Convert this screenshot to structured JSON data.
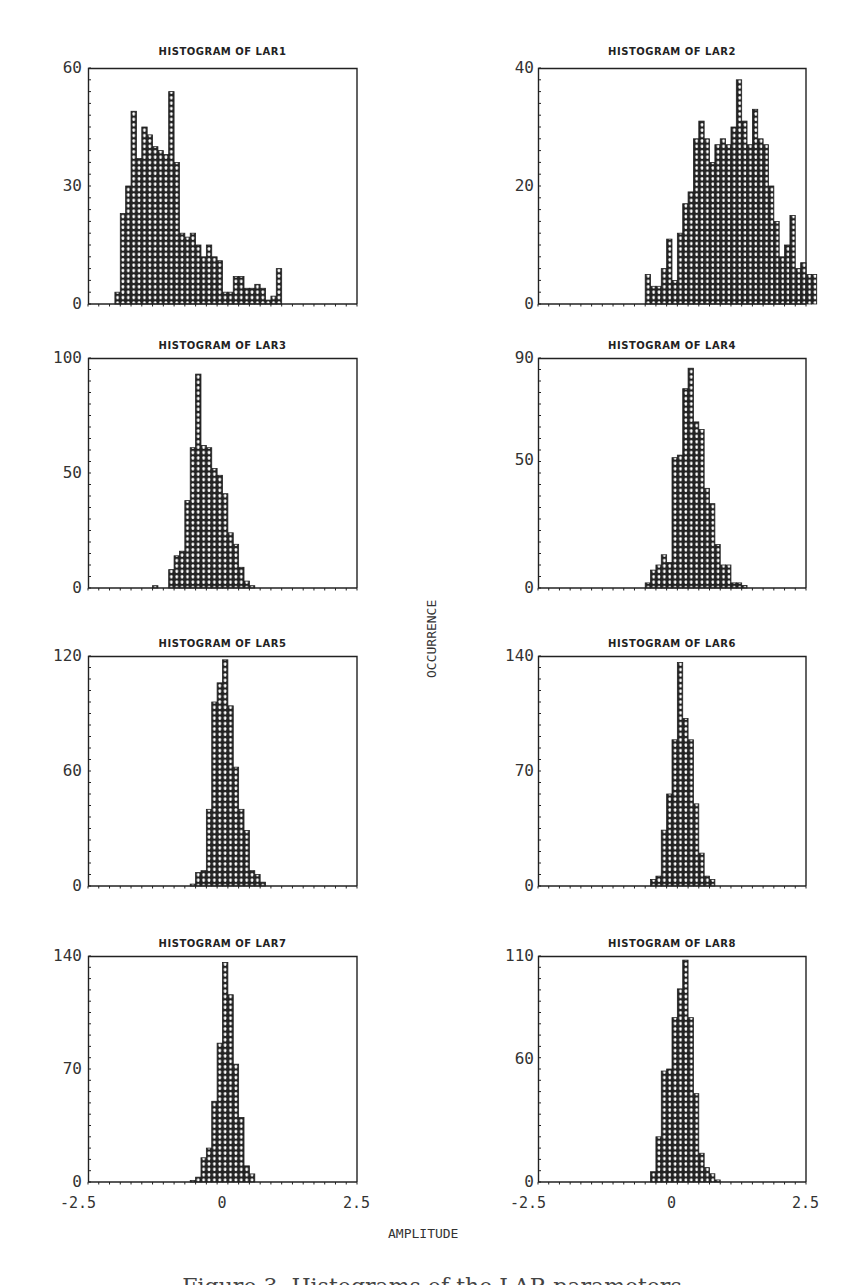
{
  "figure": {
    "y_axis_label": "OCCURRENCE",
    "x_axis_label": "AMPLITUDE",
    "x_ticks": [
      "-2.5",
      "0",
      "2.5"
    ],
    "caption_partial": "Figure 3. Histograms of the LAR parameters"
  },
  "style": {
    "ink": "#222222",
    "fill": "#ffffff"
  },
  "chart_data": [
    {
      "type": "bar",
      "title": "HISTOGRAM OF LAR1",
      "xlabel": "AMPLITUDE",
      "ylabel": "OCCURRENCE",
      "xlim": [
        -2.5,
        2.5
      ],
      "ylim": [
        0,
        60
      ],
      "y_ticks": [
        "60",
        "30",
        "0"
      ],
      "bin_width": 0.1,
      "bin_start": -2.0,
      "values": [
        3,
        23,
        30,
        49,
        37,
        45,
        43,
        40,
        39,
        38,
        54,
        36,
        18,
        17,
        18,
        15,
        12,
        15,
        12,
        11,
        3,
        3,
        7,
        7,
        4,
        4,
        5,
        4,
        1,
        2,
        9
      ]
    },
    {
      "type": "bar",
      "title": "HISTOGRAM OF LAR2",
      "xlabel": "AMPLITUDE",
      "ylabel": "OCCURRENCE",
      "xlim": [
        -2.5,
        2.5
      ],
      "ylim": [
        0,
        40
      ],
      "y_ticks": [
        "40",
        "20",
        "0"
      ],
      "bin_width": 0.1,
      "bin_start": -0.5,
      "values": [
        5,
        3,
        3,
        6,
        11,
        4,
        12,
        17,
        19,
        28,
        31,
        28,
        24,
        27,
        28,
        27,
        30,
        38,
        31,
        27,
        33,
        28,
        27,
        20,
        14,
        8,
        10,
        15,
        6,
        7,
        5,
        5
      ]
    },
    {
      "type": "bar",
      "title": "HISTOGRAM OF LAR3",
      "xlabel": "AMPLITUDE",
      "ylabel": "OCCURRENCE",
      "xlim": [
        -2.5,
        2.5
      ],
      "ylim": [
        0,
        100
      ],
      "y_ticks": [
        "100",
        "50",
        "0"
      ],
      "bin_width": 0.1,
      "bin_start": -1.3,
      "values": [
        1,
        0,
        0,
        8,
        14,
        16,
        38,
        61,
        93,
        62,
        61,
        52,
        49,
        41,
        24,
        19,
        9,
        3,
        1
      ]
    },
    {
      "type": "bar",
      "title": "HISTOGRAM OF LAR4",
      "xlabel": "AMPLITUDE",
      "ylabel": "OCCURRENCE",
      "xlim": [
        -2.5,
        2.5
      ],
      "ylim": [
        0,
        90
      ],
      "y_ticks": [
        "90",
        "50",
        "0"
      ],
      "bin_width": 0.1,
      "bin_start": -0.5,
      "values": [
        2,
        7,
        9,
        13,
        10,
        51,
        52,
        78,
        86,
        65,
        62,
        39,
        33,
        17,
        9,
        9,
        2,
        2,
        1
      ]
    },
    {
      "type": "bar",
      "title": "HISTOGRAM OF LAR5",
      "xlabel": "AMPLITUDE",
      "ylabel": "OCCURRENCE",
      "xlim": [
        -2.5,
        2.5
      ],
      "ylim": [
        0,
        120
      ],
      "y_ticks": [
        "120",
        "60",
        "0"
      ],
      "bin_width": 0.1,
      "bin_start": -0.6,
      "values": [
        1,
        7,
        8,
        40,
        96,
        106,
        118,
        94,
        62,
        40,
        29,
        8,
        6,
        2
      ]
    },
    {
      "type": "bar",
      "title": "HISTOGRAM OF LAR6",
      "xlabel": "AMPLITUDE",
      "ylabel": "OCCURRENCE",
      "xlim": [
        -2.5,
        2.5
      ],
      "ylim": [
        0,
        140
      ],
      "y_ticks": [
        "140",
        "70",
        "0"
      ],
      "bin_width": 0.1,
      "bin_start": -0.4,
      "values": [
        4,
        6,
        34,
        56,
        89,
        136,
        102,
        89,
        50,
        20,
        6,
        4
      ]
    },
    {
      "type": "bar",
      "title": "HISTOGRAM OF LAR7",
      "xlabel": "AMPLITUDE",
      "ylabel": "OCCURRENCE",
      "xlim": [
        -2.5,
        2.5
      ],
      "ylim": [
        0,
        140
      ],
      "y_ticks": [
        "140",
        "70",
        "0"
      ],
      "bin_width": 0.1,
      "bin_start": -0.6,
      "values": [
        1,
        3,
        15,
        21,
        50,
        86,
        136,
        116,
        73,
        40,
        10,
        5
      ]
    },
    {
      "type": "bar",
      "title": "HISTOGRAM OF LAR8",
      "xlabel": "AMPLITUDE",
      "ylabel": "OCCURRENCE",
      "xlim": [
        -2.5,
        2.5
      ],
      "ylim": [
        0,
        110
      ],
      "y_ticks": [
        "110",
        "60",
        "0"
      ],
      "bin_width": 0.1,
      "bin_start": -0.4,
      "values": [
        5,
        22,
        54,
        55,
        80,
        94,
        108,
        80,
        43,
        14,
        7,
        4,
        1
      ]
    }
  ]
}
